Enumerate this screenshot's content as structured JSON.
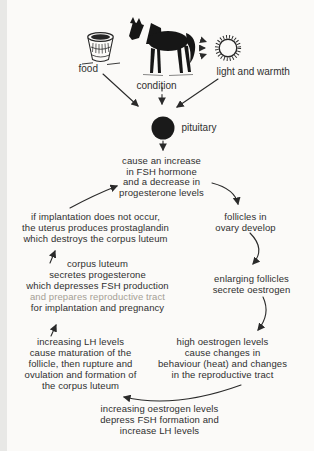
{
  "page": {
    "background": "#fbfaf8",
    "ink": "#2f2f2f",
    "arrow_color": "#2a2a2a"
  },
  "diagram": {
    "inputs": {
      "food": "food",
      "condition": "condition",
      "light": "light and warmth"
    },
    "pituitary": "pituitary",
    "icons": [
      "food-bucket-icon",
      "horse-icon",
      "sun-icon"
    ],
    "nodes": {
      "fsh": {
        "lines": [
          "cause an increase",
          "in FSH hormone",
          "and a decrease in",
          "progesterone levels"
        ]
      },
      "implantation": {
        "lines": [
          "if implantation does not occur,",
          "the uterus produces prostaglandin",
          "which destroys the corpus luteum"
        ]
      },
      "follicles": {
        "lines": [
          "follicles in",
          "ovary develop"
        ]
      },
      "corpus": {
        "lines": [
          "corpus luteum",
          "secretes progesterone",
          "which depresses FSH production",
          "and prepares reproductive tract",
          "for implantation and pregnancy"
        ]
      },
      "enlarging": {
        "lines": [
          "enlarging follicles",
          "secrete oestrogen"
        ]
      },
      "lh": {
        "lines": [
          "increasing LH levels",
          "cause maturation of the",
          "follicle, then rupture and",
          "ovulation and formation of",
          "the corpus luteum"
        ]
      },
      "high": {
        "lines": [
          "high oestrogen levels",
          "cause changes in",
          "behaviour (heat) and changes",
          "in the reproductive tract"
        ]
      },
      "feedback": {
        "lines": [
          "increasing oestrogen levels",
          "depress FSH formation and",
          "increase LH levels"
        ]
      }
    },
    "arrows": [
      {
        "from": "food",
        "to": "pituitary",
        "style": "solid"
      },
      {
        "from": "condition",
        "to": "pituitary",
        "style": "dashed"
      },
      {
        "from": "light-and-warmth",
        "to": "pituitary",
        "style": "solid"
      },
      {
        "from": "pituitary",
        "to": "fsh-increase",
        "style": "dashed"
      },
      {
        "from": "fsh-increase",
        "to": "follicles-develop",
        "style": "solid"
      },
      {
        "from": "follicles-develop",
        "to": "enlarging-follicles",
        "style": "solid"
      },
      {
        "from": "enlarging-follicles",
        "to": "high-oestrogen",
        "style": "solid"
      },
      {
        "from": "high-oestrogen",
        "to": "increasing-lh",
        "style": "solid"
      },
      {
        "from": "increasing-lh",
        "to": "corpus-luteum",
        "style": "solid"
      },
      {
        "from": "corpus-luteum",
        "to": "implantation",
        "style": "solid"
      },
      {
        "from": "implantation",
        "to": "fsh-increase",
        "style": "solid"
      }
    ]
  }
}
